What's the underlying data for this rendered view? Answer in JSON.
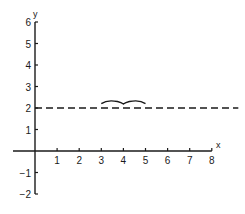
{
  "chart_data": {
    "type": "line",
    "title": "",
    "xlabel": "x",
    "ylabel": "y",
    "xlim": [
      0,
      8
    ],
    "ylim": [
      -2,
      6
    ],
    "x_ticks": [
      1,
      2,
      3,
      4,
      5,
      6,
      7,
      8
    ],
    "y_ticks": [
      -2,
      -1,
      1,
      2,
      3,
      4,
      5,
      6
    ],
    "x_tick_labels": [
      "1",
      "2",
      "3",
      "4",
      "5",
      "6",
      "7",
      "8"
    ],
    "y_tick_labels": [
      "−2",
      "−1",
      "1",
      "2",
      "3",
      "4",
      "5",
      "6"
    ],
    "grid": false,
    "legend": null,
    "series": [
      {
        "name": "dashed horizontal line y = 2",
        "style": "dashed",
        "x": [
          0,
          9.2
        ],
        "y": [
          2,
          2
        ]
      },
      {
        "name": "brace over interval",
        "style": "curly-brace",
        "x": [
          3,
          5
        ],
        "y": [
          2.3,
          2.3
        ]
      }
    ],
    "colors": {
      "axis": "#1a1a1a",
      "line": "#1a1a1a"
    }
  }
}
